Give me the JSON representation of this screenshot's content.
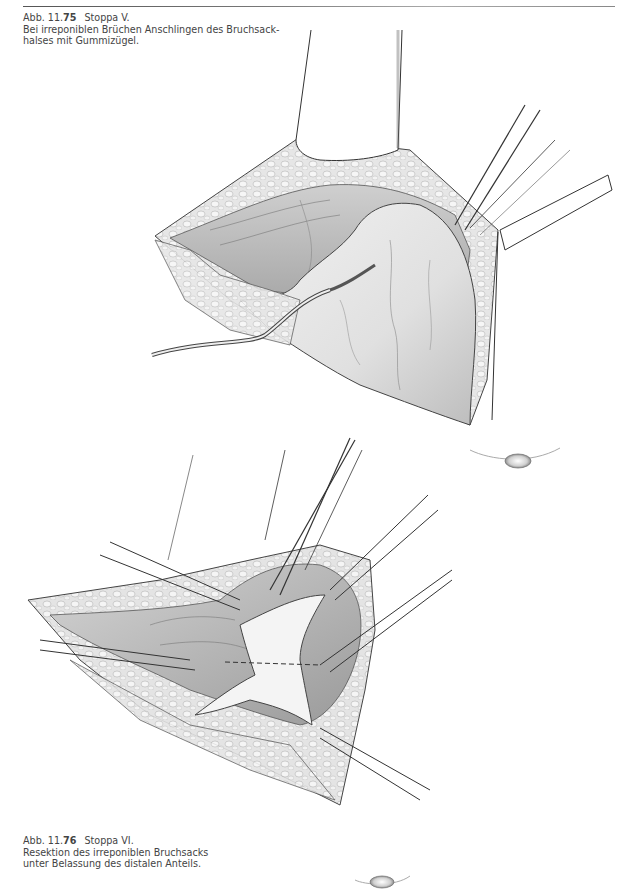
{
  "page": {
    "header": {
      "text": "256   11 Leistenhernie"
    },
    "figures": [
      {
        "label_prefix": "Abb. 11.",
        "label_number": "75",
        "title": "Stoppa V.",
        "description_lines": [
          "Bei irreponiblen Brüchen Anschlingen des Bruchsack-",
          "halses mit Gummizügel."
        ],
        "illustration": "surgical-illustration-stoppa-v"
      },
      {
        "label_prefix": "Abb. 11.",
        "label_number": "76",
        "title": "Stoppa VI.",
        "description_lines": [
          "Resektion des irreponiblen Bruchsacks",
          "unter Belassung des distalen Anteils."
        ],
        "illustration": "surgical-illustration-stoppa-vi"
      }
    ]
  },
  "colors": {
    "text": "#444444",
    "rule": "#777777",
    "ink": "#3b3b3b",
    "tissue": "#d9d9d9",
    "background": "#ffffff"
  }
}
